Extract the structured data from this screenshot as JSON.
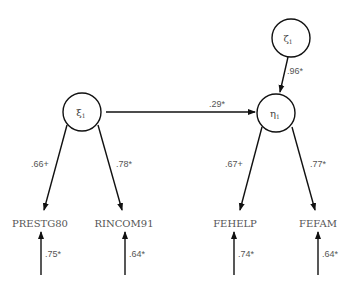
{
  "diagram": {
    "type": "structural-equation-model",
    "latent_nodes": [
      {
        "id": "zeta1",
        "symbol": "ζ",
        "subscript": "1"
      },
      {
        "id": "xi1",
        "symbol": "ξ",
        "subscript": "1"
      },
      {
        "id": "eta1",
        "symbol": "η",
        "subscript": "1"
      }
    ],
    "observed_nodes": [
      {
        "id": "prestg80",
        "label": "PRESTG80"
      },
      {
        "id": "rincom91",
        "label": "RINCOM91"
      },
      {
        "id": "fehelp",
        "label": "FEHELP"
      },
      {
        "id": "fefam",
        "label": "FEFAM"
      }
    ],
    "paths": [
      {
        "from": "zeta1",
        "to": "eta1",
        "coef": ".96*"
      },
      {
        "from": "xi1",
        "to": "eta1",
        "coef": ".29*"
      },
      {
        "from": "xi1",
        "to": "prestg80",
        "coef": ".66+"
      },
      {
        "from": "xi1",
        "to": "rincom91",
        "coef": ".78*"
      },
      {
        "from": "eta1",
        "to": "fehelp",
        "coef": ".67+"
      },
      {
        "from": "eta1",
        "to": "fefam",
        "coef": ".77*"
      }
    ],
    "error_paths": [
      {
        "to": "prestg80",
        "coef": ".75*"
      },
      {
        "to": "rincom91",
        "coef": ".64*"
      },
      {
        "to": "fehelp",
        "coef": ".74*"
      },
      {
        "to": "fefam",
        "coef": ".64*"
      }
    ]
  }
}
